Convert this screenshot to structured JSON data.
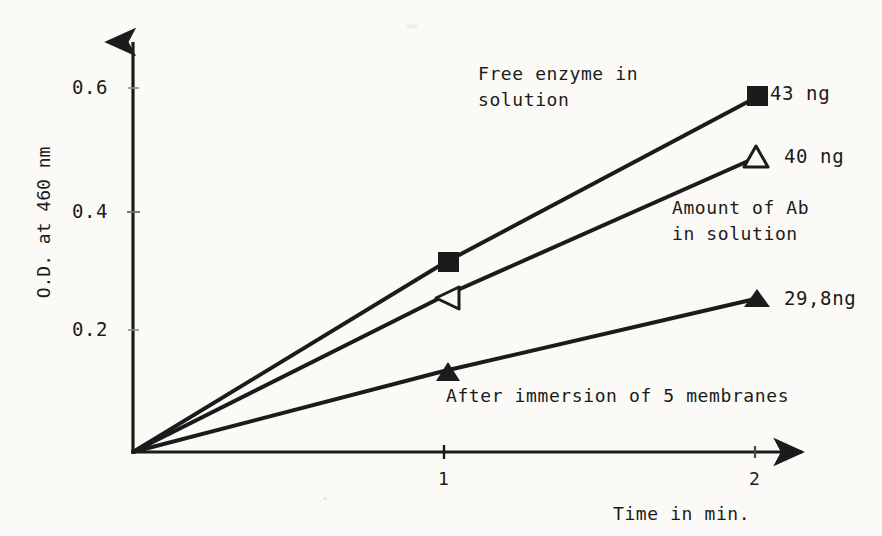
{
  "figure": {
    "background_color": "#fbfaf7",
    "ink_color": "#1b1b1b"
  },
  "chart_data": {
    "type": "line",
    "title": "",
    "xlabel": "Time in min.",
    "ylabel": "O.D. at 460 nm",
    "x": [
      0,
      1,
      2
    ],
    "xlim": [
      0,
      2.18
    ],
    "ylim": [
      0,
      0.69
    ],
    "xticks": [
      "1",
      "2"
    ],
    "xtick_values": [
      1,
      2
    ],
    "yticks": [
      "0.2",
      "0.4",
      "0.6"
    ],
    "ytick_values": [
      0.2,
      0.4,
      0.6
    ],
    "grid": false,
    "legend": "none",
    "axis_style": "arrow-ended open axes",
    "series": [
      {
        "name": "43 ng",
        "marker": "filled-square",
        "description": "Free enzyme in solution",
        "x": [
          0,
          1,
          2
        ],
        "values": [
          0.0,
          0.315,
          0.59
        ]
      },
      {
        "name": "40 ng",
        "marker": "open-triangle",
        "description": "Amount of Ab in solution",
        "x": [
          0,
          1,
          2
        ],
        "values": [
          0.0,
          0.26,
          0.49
        ]
      },
      {
        "name": "29,8ng",
        "marker": "filled-triangle",
        "description": "After immersion of 5 membranes",
        "x": [
          0,
          1,
          2
        ],
        "values": [
          0.0,
          0.135,
          0.255
        ]
      }
    ],
    "annotations": [
      {
        "text": "Free enzyme in",
        "x": 478,
        "y": 62
      },
      {
        "text": "solution",
        "x": 478,
        "y": 88
      },
      {
        "text": "Amount of Ab",
        "x": 672,
        "y": 196
      },
      {
        "text": "in solution",
        "x": 672,
        "y": 222
      },
      {
        "text": "After immersion of 5 membranes",
        "x": 446,
        "y": 384
      }
    ],
    "point_labels": [
      {
        "text": "43 ng",
        "marker": "filled-square",
        "x": 771,
        "y": 82
      },
      {
        "text": "40 ng",
        "marker": "open-triangle",
        "x": 784,
        "y": 146
      },
      {
        "text": "29,8ng",
        "marker": "filled-triangle",
        "x": 784,
        "y": 288
      }
    ]
  },
  "axis_labels": {
    "y_title": "O.D. at 460 nm",
    "x_title": "Time in min.",
    "y_tick_0": "0.6",
    "y_tick_1": "0.4",
    "y_tick_2": "0.2",
    "x_tick_0": "1",
    "x_tick_1": "2"
  },
  "annotations": {
    "free_enzyme_line1": "Free enzyme in",
    "free_enzyme_line2": "solution",
    "amount_ab_line1": "Amount of Ab",
    "amount_ab_line2": "in solution",
    "after_immersion": "After immersion of 5 membranes"
  },
  "point_labels": {
    "square_43": "43 ng",
    "triangle_open_40": "40 ng",
    "triangle_filled_298": "29,8ng"
  }
}
